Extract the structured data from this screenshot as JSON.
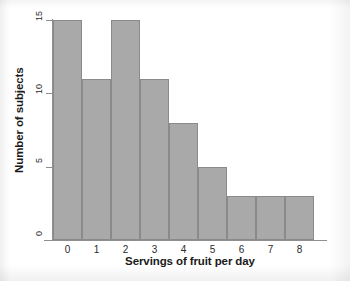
{
  "chart_data": {
    "type": "bar",
    "title": "",
    "xlabel": "Servings of fruit per day",
    "ylabel": "Number of subjects",
    "categories": [
      "0",
      "1",
      "2",
      "3",
      "4",
      "5",
      "6",
      "7",
      "8"
    ],
    "values": [
      15,
      11,
      15,
      11,
      8,
      5,
      3,
      3,
      3
    ],
    "ylim": [
      0,
      15
    ],
    "yticks": [
      0,
      5,
      10,
      15
    ],
    "ytick_labels": [
      "0",
      "5",
      "10",
      "15"
    ],
    "xtick_labels": [
      "0",
      "1",
      "2",
      "3",
      "4",
      "5",
      "6",
      "7",
      "8"
    ],
    "grid": false,
    "legend": false,
    "bar_fill_color": "#a9a9a9",
    "bar_border_color": "#8a8a8a",
    "axis_color": "#8f8f8f",
    "plot_background": "#ffffff"
  }
}
